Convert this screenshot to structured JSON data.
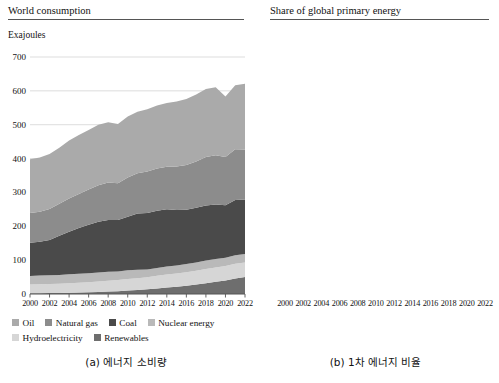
{
  "figure": {
    "panel_a": {
      "title": "World consumption",
      "unit_label": "Exajoules",
      "caption": "(a) 에너지 소비량"
    },
    "panel_b": {
      "title": "Share of global primary energy",
      "caption": "(b) 1차 에너지 비율"
    }
  },
  "colors": {
    "oil": "#aaaaaa",
    "natural_gas": "#8c8c8c",
    "coal": "#4a4a4a",
    "nuclear_energy": "#b9b9b9",
    "hydroelectricity": "#d6d6d6",
    "renewables": "#6e6e6e",
    "gridline": "#d9d9d9",
    "axis": "#555555",
    "line_oil": "#9a9a9a",
    "line_coal": "#4a4a4a",
    "line_gas": "#8a8a8a",
    "line_hydro": "#b0b0b0",
    "line_nuclear": "#a0a0a0",
    "line_renewables": "#555555"
  },
  "legend_a": {
    "rows": [
      [
        {
          "label": "Oil",
          "color": "#aaaaaa"
        },
        {
          "label": "Natural gas",
          "color": "#8c8c8c"
        },
        {
          "label": "Coal",
          "color": "#4a4a4a"
        },
        {
          "label": "Nuclear energy",
          "color": "#b9b9b9"
        }
      ],
      [
        {
          "label": "Hydroelectricity",
          "color": "#d6d6d6"
        },
        {
          "label": "Renewables",
          "color": "#6e6e6e"
        }
      ]
    ]
  },
  "legend_b": {
    "rows": [
      [
        {
          "label": "Oil",
          "color": "#9a9a9a"
        },
        {
          "label": "Coal",
          "color": "#4a4a4a"
        },
        {
          "label": "Natural gas",
          "color": "#8a8a8a"
        },
        {
          "label": "Hydroelectricity",
          "color": "#b0b0b0"
        }
      ],
      [
        {
          "label": "Nuclear energy",
          "color": "#a0a0a0"
        },
        {
          "label": "Renewables",
          "color": "#555555"
        }
      ]
    ]
  },
  "chart_data": [
    {
      "id": "panel-a",
      "type": "area",
      "title": "World consumption",
      "subtitle": "",
      "xlabel": "",
      "ylabel": "Exajoules",
      "stacked": true,
      "grid": true,
      "legend_position": "bottom",
      "xlim": [
        2000,
        2022
      ],
      "ylim": [
        0,
        700
      ],
      "yticks": [
        0,
        100,
        200,
        300,
        400,
        500,
        600,
        700
      ],
      "ytick_labels": [
        "0",
        "100",
        "200",
        "300",
        "400",
        "500",
        "600",
        "700"
      ],
      "xticks": [
        2000,
        2002,
        2004,
        2006,
        2008,
        2010,
        2012,
        2014,
        2016,
        2018,
        2020,
        2022
      ],
      "xtick_labels": [
        "2000",
        "2002",
        "2004",
        "2006",
        "2008",
        "2010",
        "2012",
        "2014",
        "2016",
        "2018",
        "2020",
        "2022"
      ],
      "x": [
        2000,
        2001,
        2002,
        2003,
        2004,
        2005,
        2006,
        2007,
        2008,
        2009,
        2010,
        2011,
        2012,
        2013,
        2014,
        2015,
        2016,
        2017,
        2018,
        2019,
        2020,
        2021,
        2022
      ],
      "stack_order": [
        "Renewables",
        "Hydroelectricity",
        "Nuclear energy",
        "Coal",
        "Natural gas",
        "Oil"
      ],
      "series": [
        {
          "name": "Renewables",
          "color": "#6e6e6e",
          "values": [
            2.2,
            2.5,
            2.8,
            3.1,
            3.6,
            4.2,
            5.0,
            6.0,
            7.2,
            8.4,
            10.0,
            12.0,
            14.0,
            16.4,
            19.0,
            21.6,
            24.6,
            28.2,
            32.0,
            36.0,
            40.2,
            46.0,
            50.4
          ]
        },
        {
          "name": "Hydroelectricity",
          "color": "#d6d6d6",
          "values": [
            26.0,
            26.4,
            26.8,
            27.2,
            28.2,
            29.0,
            30.0,
            30.8,
            32.0,
            32.8,
            34.0,
            34.4,
            35.8,
            37.4,
            38.4,
            38.8,
            39.8,
            40.6,
            41.6,
            42.2,
            42.8,
            43.0,
            42.8
          ]
        },
        {
          "name": "Nuclear energy",
          "color": "#b9b9b9",
          "values": [
            25.0,
            25.4,
            25.8,
            25.6,
            26.4,
            26.4,
            26.6,
            26.4,
            26.2,
            25.6,
            26.2,
            25.0,
            22.8,
            23.2,
            23.6,
            24.0,
            24.4,
            24.6,
            25.0,
            25.4,
            24.4,
            25.6,
            24.6
          ]
        },
        {
          "name": "Coal",
          "color": "#4a4a4a",
          "values": [
            98.0,
            100.0,
            104.0,
            116.0,
            126.0,
            135.0,
            143.0,
            150.0,
            153.0,
            152.0,
            158.0,
            166.0,
            167.0,
            169.0,
            169.0,
            164.0,
            160.0,
            161.0,
            163.0,
            161.0,
            155.0,
            163.0,
            161.0
          ]
        },
        {
          "name": "Natural gas",
          "color": "#8c8c8c",
          "values": [
            88.0,
            89.0,
            92.0,
            95.0,
            98.0,
            101.0,
            104.0,
            108.0,
            111.0,
            108.0,
            116.0,
            119.0,
            122.0,
            125.0,
            126.0,
            128.0,
            132.0,
            137.0,
            143.0,
            145.0,
            142.0,
            150.0,
            148.0
          ]
        },
        {
          "name": "Oil",
          "color": "#aaaaaa",
          "values": [
            159.0,
            160.0,
            162.0,
            165.0,
            171.0,
            174.0,
            176.0,
            179.0,
            178.0,
            175.0,
            180.0,
            182.0,
            184.0,
            186.0,
            188.0,
            192.0,
            195.0,
            198.0,
            201.0,
            201.0,
            179.0,
            189.0,
            194.0
          ]
        }
      ],
      "totals": [
        398.2,
        403.3,
        413.4,
        431.9,
        453.2,
        469.6,
        484.6,
        500.2,
        507.4,
        501.8,
        524.2,
        538.4,
        546.6,
        557.0,
        564.0,
        568.4,
        575.8,
        589.4,
        605.6,
        610.6,
        583.4,
        616.6,
        620.8
      ]
    },
    {
      "id": "panel-b",
      "type": "line",
      "title": "Share of global primary energy",
      "subtitle": "",
      "xlabel": "",
      "ylabel": "",
      "grid": true,
      "legend_position": "bottom",
      "xlim": [
        2000,
        2022
      ],
      "ylim": [
        0,
        40
      ],
      "yticks": [
        0,
        5,
        10,
        15,
        20,
        25,
        30,
        35,
        40
      ],
      "ytick_labels": [
        "0",
        "5%",
        "10%",
        "15%",
        "20%",
        "25%",
        "30%",
        "35%",
        "40%"
      ],
      "xticks": [
        2000,
        2002,
        2004,
        2006,
        2008,
        2010,
        2012,
        2014,
        2016,
        2018,
        2020,
        2022
      ],
      "xtick_labels": [
        "2000",
        "2002",
        "2004",
        "2006",
        "2008",
        "2010",
        "2012",
        "2014",
        "2016",
        "2018",
        "2020",
        "2022"
      ],
      "x": [
        2000,
        2001,
        2002,
        2003,
        2004,
        2005,
        2006,
        2007,
        2008,
        2009,
        2010,
        2011,
        2012,
        2013,
        2014,
        2015,
        2016,
        2017,
        2018,
        2019,
        2020,
        2021,
        2022
      ],
      "series": [
        {
          "name": "Oil",
          "color": "#9a9a9a",
          "values": [
            39.4,
            39.2,
            38.8,
            38.3,
            37.6,
            37.0,
            36.3,
            35.6,
            34.9,
            34.5,
            34.0,
            33.6,
            33.4,
            33.3,
            33.2,
            33.6,
            33.8,
            33.6,
            33.2,
            32.9,
            30.7,
            30.6,
            31.4
          ]
        },
        {
          "name": "Coal",
          "color": "#4a4a4a",
          "values": [
            24.6,
            24.8,
            25.2,
            26.8,
            27.8,
            28.8,
            29.5,
            30.0,
            30.1,
            30.3,
            30.1,
            30.8,
            30.6,
            30.3,
            30.0,
            28.9,
            27.8,
            27.3,
            26.9,
            26.4,
            26.6,
            26.4,
            26.7
          ]
        },
        {
          "name": "Natural gas",
          "color": "#8a8a8a",
          "values": [
            22.1,
            22.1,
            22.3,
            22.0,
            21.6,
            21.5,
            21.5,
            21.6,
            21.9,
            21.5,
            22.1,
            22.1,
            22.3,
            22.4,
            22.3,
            22.5,
            22.9,
            23.2,
            23.6,
            23.7,
            24.3,
            24.3,
            23.8
          ]
        },
        {
          "name": "Hydroelectricity",
          "color": "#b0b0b0",
          "values": [
            6.5,
            6.5,
            6.5,
            6.3,
            6.2,
            6.2,
            6.2,
            6.2,
            6.3,
            6.5,
            6.5,
            6.4,
            6.5,
            6.7,
            6.8,
            6.8,
            6.9,
            6.9,
            6.9,
            6.9,
            7.3,
            7.0,
            6.9
          ]
        },
        {
          "name": "Nuclear energy",
          "color": "#a0a0a0",
          "values": [
            6.3,
            6.3,
            6.2,
            5.9,
            5.8,
            5.6,
            5.5,
            5.3,
            5.2,
            5.1,
            5.0,
            4.6,
            4.2,
            4.2,
            4.2,
            4.2,
            4.2,
            4.2,
            4.1,
            4.2,
            4.2,
            4.2,
            4.0
          ]
        },
        {
          "name": "Renewables",
          "color": "#555555",
          "values": [
            0.55,
            0.62,
            0.68,
            0.72,
            0.8,
            0.9,
            1.03,
            1.2,
            1.42,
            1.67,
            1.91,
            2.23,
            2.56,
            2.95,
            3.37,
            3.8,
            4.27,
            4.78,
            5.28,
            5.9,
            6.89,
            7.46,
            7.5
          ]
        }
      ]
    }
  ]
}
